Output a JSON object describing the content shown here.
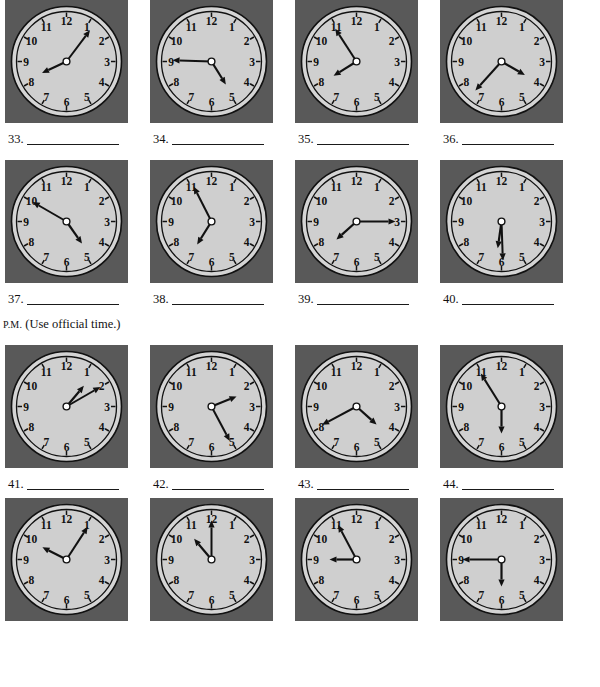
{
  "page": {
    "background": "#ffffff",
    "ink": "#111111"
  },
  "style": {
    "clock_frame_color": "#595959",
    "clock_face_color": "#d4d4d4",
    "clock_face_inner_color": "#cfcfcf",
    "clock_outline_color": "#111111",
    "hand_color": "#111111"
  },
  "instruction": {
    "prefix": "P.M.",
    "text": " (Use official time.)"
  },
  "numerals": [
    "12",
    "1",
    "2",
    "3",
    "4",
    "5",
    "6",
    "7",
    "8",
    "9",
    "10",
    "11"
  ],
  "clocks": [
    {
      "id": 33,
      "number_label": "33.",
      "answer_value": "",
      "hour_angle": 245,
      "minute_angle": 37,
      "name": "clock-33"
    },
    {
      "id": 34,
      "number_label": "34.",
      "answer_value": "",
      "hour_angle": 148,
      "minute_angle": 272,
      "name": "clock-34"
    },
    {
      "id": 35,
      "number_label": "35.",
      "answer_value": "",
      "hour_angle": 238,
      "minute_angle": 327,
      "name": "clock-35"
    },
    {
      "id": 36,
      "number_label": "36.",
      "answer_value": "",
      "hour_angle": 120,
      "minute_angle": 222,
      "name": "clock-36"
    },
    {
      "id": 37,
      "number_label": "37.",
      "answer_value": "",
      "hour_angle": 145,
      "minute_angle": 300,
      "name": "clock-37"
    },
    {
      "id": 38,
      "number_label": "38.",
      "answer_value": "",
      "hour_angle": 212,
      "minute_angle": 333,
      "name": "clock-38"
    },
    {
      "id": 39,
      "number_label": "39.",
      "answer_value": "",
      "hour_angle": 228,
      "minute_angle": 90,
      "name": "clock-39"
    },
    {
      "id": 40,
      "number_label": "40.",
      "answer_value": "",
      "hour_angle": 188,
      "minute_angle": 178,
      "name": "clock-40"
    },
    {
      "id": 41,
      "number_label": "41.",
      "answer_value": "",
      "hour_angle": 40,
      "minute_angle": 60,
      "name": "clock-41"
    },
    {
      "id": 42,
      "number_label": "42.",
      "answer_value": "",
      "hour_angle": 68,
      "minute_angle": 152,
      "name": "clock-42"
    },
    {
      "id": 43,
      "number_label": "43.",
      "answer_value": "",
      "hour_angle": 132,
      "minute_angle": 242,
      "name": "clock-43"
    },
    {
      "id": 44,
      "number_label": "44.",
      "answer_value": "",
      "hour_angle": 180,
      "minute_angle": 328,
      "name": "clock-44"
    },
    {
      "id": 45,
      "number_label": "45.",
      "answer_value": "",
      "hour_angle": 297,
      "minute_angle": 33,
      "name": "clock-45"
    },
    {
      "id": 46,
      "number_label": "46.",
      "answer_value": "",
      "hour_angle": 320,
      "minute_angle": 0,
      "name": "clock-46"
    },
    {
      "id": 47,
      "number_label": "47.",
      "answer_value": "",
      "hour_angle": 270,
      "minute_angle": 332,
      "name": "clock-47"
    },
    {
      "id": 48,
      "number_label": "48.",
      "answer_value": "",
      "hour_angle": 180,
      "minute_angle": 270,
      "name": "clock-48"
    }
  ]
}
